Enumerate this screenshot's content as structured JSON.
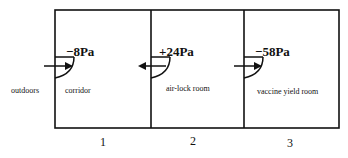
{
  "diagram": {
    "type": "pressure-cascade-floor-plan",
    "colors": {
      "line": "#111111",
      "background": "#ffffff"
    },
    "outside": {
      "label": "outdoors"
    },
    "rooms": [
      {
        "number": "1",
        "label": "corridor",
        "pressure": "−8Pa"
      },
      {
        "number": "2",
        "label": "air-lock room",
        "pressure": "+24Pa"
      },
      {
        "number": "3",
        "label": "vaccine yield room",
        "pressure": "−58Pa"
      }
    ],
    "doors": [
      {
        "between": "outdoors-corridor",
        "airflow": "right"
      },
      {
        "between": "corridor-air-lock room",
        "airflow": "left"
      },
      {
        "between": "air-lock room-vaccine yield room",
        "airflow": "right"
      }
    ]
  }
}
